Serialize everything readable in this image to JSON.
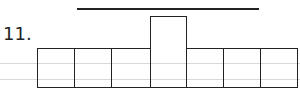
{
  "problem": {
    "number_label": "11.",
    "description": "Net of a shape: row of 7 squares with a raised tall box in the middle and a line above"
  },
  "diagram": {
    "top_line": {
      "x1": 77,
      "x2": 259,
      "y": 9
    },
    "guide_lines_y": [
      63,
      79
    ],
    "tall_box": {
      "x": 150,
      "y": 16,
      "w": 37,
      "h": 72
    },
    "row_boxes": [
      {
        "x": 37,
        "y": 48,
        "w": 38,
        "h": 40
      },
      {
        "x": 74,
        "y": 48,
        "w": 38,
        "h": 40
      },
      {
        "x": 111,
        "y": 48,
        "w": 40,
        "h": 40
      },
      {
        "x": 186,
        "y": 48,
        "w": 38,
        "h": 40
      },
      {
        "x": 223,
        "y": 48,
        "w": 38,
        "h": 40
      },
      {
        "x": 260,
        "y": 48,
        "w": 38,
        "h": 40
      }
    ],
    "colors": {
      "stroke": "#222222",
      "guide": "#d9d9d9",
      "background": "#ffffff"
    }
  }
}
